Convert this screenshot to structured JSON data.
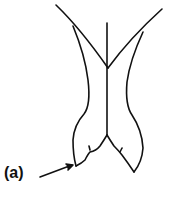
{
  "diagram": {
    "type": "line-drawing",
    "labels": [
      {
        "id": "a",
        "text": "(a)",
        "points_to": "lower-left lobe tip"
      }
    ],
    "colors": {
      "stroke": "#111111",
      "background": "#ffffff"
    }
  }
}
